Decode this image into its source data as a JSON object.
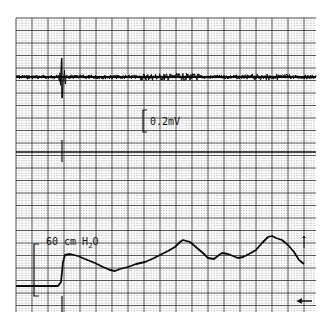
{
  "chart_data": {
    "type": "line",
    "title": "",
    "grid": {
      "x0": 16,
      "x1": 316,
      "y0": 18,
      "y1": 312,
      "major_dx": 16,
      "major_dy": 12.5,
      "minor_div": 5,
      "major_color": "#333333",
      "minor_color": "#9a9a9a"
    },
    "divider_y": 152,
    "series": [
      {
        "name": "EMG",
        "baseline_y": 77,
        "spike_x": 62,
        "spike_top_y": 58,
        "spike_bottom_y": 98,
        "scale_label": "0.2mV",
        "scale_bar": {
          "x": 143,
          "y_top": 110,
          "y_bottom": 132
        }
      },
      {
        "name": "Pressure",
        "scale_label": "60 cm H2O",
        "scale_bar": {
          "x": 34,
          "y_top": 244,
          "y_bottom": 296
        },
        "points": [
          [
            16,
            286
          ],
          [
            30,
            286
          ],
          [
            45,
            286
          ],
          [
            58,
            286
          ],
          [
            61,
            282
          ],
          [
            63,
            262
          ],
          [
            65,
            255
          ],
          [
            70,
            254
          ],
          [
            78,
            256
          ],
          [
            85,
            259
          ],
          [
            95,
            263
          ],
          [
            103,
            267
          ],
          [
            110,
            270
          ],
          [
            115,
            271
          ],
          [
            120,
            269
          ],
          [
            128,
            267
          ],
          [
            136,
            264
          ],
          [
            145,
            262
          ],
          [
            152,
            259
          ],
          [
            160,
            255
          ],
          [
            168,
            251
          ],
          [
            175,
            247
          ],
          [
            180,
            242
          ],
          [
            183,
            240
          ],
          [
            190,
            242
          ],
          [
            197,
            248
          ],
          [
            203,
            253
          ],
          [
            208,
            258
          ],
          [
            214,
            259
          ],
          [
            219,
            255
          ],
          [
            222,
            253
          ],
          [
            228,
            254
          ],
          [
            233,
            256
          ],
          [
            238,
            258
          ],
          [
            243,
            257
          ],
          [
            249,
            254
          ],
          [
            256,
            250
          ],
          [
            262,
            243
          ],
          [
            268,
            237
          ],
          [
            272,
            236
          ],
          [
            276,
            238
          ],
          [
            282,
            240
          ],
          [
            288,
            245
          ],
          [
            294,
            252
          ],
          [
            299,
            260
          ],
          [
            304,
            264
          ]
        ]
      }
    ],
    "annotations": [
      {
        "text": "0.2mV",
        "x": 150,
        "y": 125
      },
      {
        "text": "60 cm H",
        "x": 46,
        "y": 245,
        "subscript": "2",
        "suffix": "O"
      }
    ],
    "markers": {
      "event_line_x": 62,
      "right_tick": {
        "x": 304,
        "y_top": 236,
        "y_bottom": 248
      },
      "end_arrow": {
        "x": 298,
        "y": 301
      }
    }
  }
}
